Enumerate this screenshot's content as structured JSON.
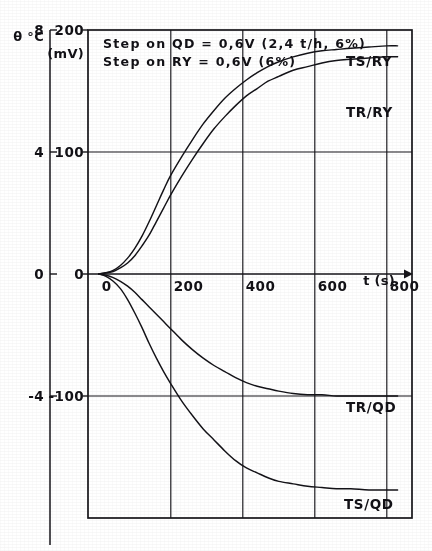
{
  "chart_data": {
    "type": "line",
    "title": "",
    "xlabel": "t (s)",
    "ylabel_left": "θ °C",
    "ylabel_right": "(mV)",
    "xlim": [
      -30,
      870
    ],
    "ylim": [
      -200,
      200
    ],
    "grid": true,
    "legend_position": "inline-right",
    "xticks": [
      0,
      200,
      400,
      600,
      800
    ],
    "xticklabels": [
      "0",
      "200",
      "400",
      "600",
      "800"
    ],
    "yticks_mv": [
      200,
      100,
      0,
      -100
    ],
    "yticklabels_mv": [
      "200",
      "100",
      "0",
      "-100"
    ],
    "yticks_degc": [
      8,
      4,
      0,
      -4
    ],
    "yticklabels_degc": [
      "8",
      "4",
      "0",
      "-4"
    ],
    "annotations": [
      "Step on QD = 0,6V (2,4 t/h, 6%)",
      "Step on RY = 0,6V (6%)"
    ],
    "series": [
      {
        "name": "TS/RY",
        "label": "TS/RY",
        "color": "#17161b",
        "points": [
          [
            0,
            0
          ],
          [
            20,
            1
          ],
          [
            40,
            3
          ],
          [
            60,
            7
          ],
          [
            80,
            13
          ],
          [
            100,
            21
          ],
          [
            120,
            31
          ],
          [
            140,
            43
          ],
          [
            160,
            56
          ],
          [
            180,
            69
          ],
          [
            200,
            81
          ],
          [
            230,
            96
          ],
          [
            260,
            110
          ],
          [
            290,
            123
          ],
          [
            320,
            134
          ],
          [
            350,
            144
          ],
          [
            380,
            152
          ],
          [
            410,
            159
          ],
          [
            440,
            165
          ],
          [
            470,
            170
          ],
          [
            500,
            174
          ],
          [
            540,
            178
          ],
          [
            580,
            181
          ],
          [
            620,
            183
          ],
          [
            660,
            184
          ],
          [
            700,
            185
          ],
          [
            750,
            186
          ],
          [
            800,
            187
          ],
          [
            830,
            187
          ]
        ]
      },
      {
        "name": "TR/RY",
        "label": "TR/RY",
        "color": "#17161b",
        "points": [
          [
            0,
            0
          ],
          [
            20,
            1
          ],
          [
            40,
            2
          ],
          [
            60,
            5
          ],
          [
            80,
            9
          ],
          [
            100,
            15
          ],
          [
            120,
            23
          ],
          [
            140,
            32
          ],
          [
            160,
            43
          ],
          [
            180,
            54
          ],
          [
            200,
            65
          ],
          [
            230,
            80
          ],
          [
            260,
            94
          ],
          [
            290,
            107
          ],
          [
            320,
            119
          ],
          [
            350,
            129
          ],
          [
            380,
            138
          ],
          [
            410,
            146
          ],
          [
            440,
            152
          ],
          [
            470,
            158
          ],
          [
            500,
            162
          ],
          [
            540,
            167
          ],
          [
            580,
            170
          ],
          [
            620,
            173
          ],
          [
            660,
            175
          ],
          [
            700,
            176
          ],
          [
            750,
            177
          ],
          [
            800,
            178
          ],
          [
            830,
            178
          ]
        ]
      },
      {
        "name": "TR/QD",
        "label": "TR/QD",
        "color": "#17161b",
        "points": [
          [
            0,
            0
          ],
          [
            20,
            -1
          ],
          [
            40,
            -3
          ],
          [
            60,
            -6
          ],
          [
            80,
            -10
          ],
          [
            100,
            -15
          ],
          [
            120,
            -21
          ],
          [
            140,
            -27
          ],
          [
            160,
            -33
          ],
          [
            180,
            -39
          ],
          [
            200,
            -45
          ],
          [
            230,
            -54
          ],
          [
            260,
            -62
          ],
          [
            290,
            -69
          ],
          [
            320,
            -75
          ],
          [
            350,
            -80
          ],
          [
            380,
            -85
          ],
          [
            410,
            -89
          ],
          [
            440,
            -92
          ],
          [
            470,
            -94
          ],
          [
            500,
            -96
          ],
          [
            540,
            -98
          ],
          [
            580,
            -99
          ],
          [
            620,
            -99
          ],
          [
            660,
            -100
          ],
          [
            700,
            -100
          ],
          [
            750,
            -100
          ],
          [
            800,
            -100
          ],
          [
            830,
            -100
          ]
        ]
      },
      {
        "name": "TS/QD",
        "label": "TS/QD",
        "color": "#17161b",
        "points": [
          [
            0,
            0
          ],
          [
            20,
            -2
          ],
          [
            40,
            -6
          ],
          [
            60,
            -12
          ],
          [
            80,
            -21
          ],
          [
            100,
            -32
          ],
          [
            120,
            -44
          ],
          [
            140,
            -57
          ],
          [
            160,
            -69
          ],
          [
            180,
            -80
          ],
          [
            200,
            -90
          ],
          [
            230,
            -104
          ],
          [
            260,
            -116
          ],
          [
            290,
            -127
          ],
          [
            320,
            -136
          ],
          [
            350,
            -145
          ],
          [
            380,
            -153
          ],
          [
            410,
            -159
          ],
          [
            440,
            -163
          ],
          [
            470,
            -167
          ],
          [
            500,
            -170
          ],
          [
            540,
            -172
          ],
          [
            580,
            -174
          ],
          [
            620,
            -175
          ],
          [
            660,
            -176
          ],
          [
            700,
            -176
          ],
          [
            750,
            -177
          ],
          [
            800,
            -177
          ],
          [
            830,
            -177
          ]
        ]
      }
    ]
  }
}
